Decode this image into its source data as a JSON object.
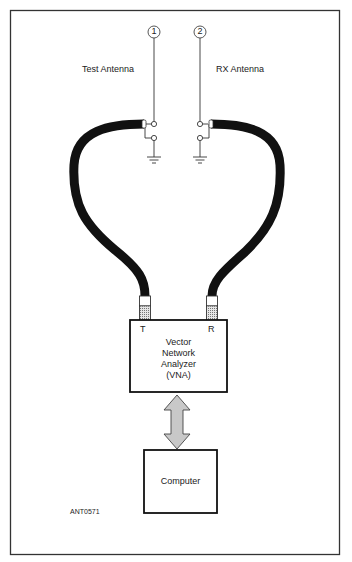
{
  "diagram": {
    "antennas": [
      {
        "number": "1",
        "label": "Test Antenna"
      },
      {
        "number": "2",
        "label": "RX Antenna"
      }
    ],
    "vna": {
      "port_t": "T",
      "port_r": "R",
      "line1": "Vector",
      "line2": "Network",
      "line3": "Analyzer",
      "line4": "(VNA)"
    },
    "computer": {
      "label": "Computer"
    },
    "figure_id": "ANT0571",
    "colors": {
      "cable": "#111111",
      "arrow_fill": "#c8c8c8",
      "frame": "#333333"
    }
  }
}
